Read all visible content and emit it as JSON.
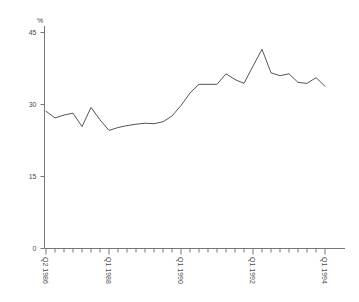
{
  "chart_data": {
    "type": "line",
    "title": "",
    "subtitle": "",
    "xlabel": "",
    "ylabel": "%",
    "ylim": [
      0,
      45
    ],
    "yticks": [
      0,
      15,
      30,
      45
    ],
    "ytick_labels": [
      "0",
      "15",
      "30",
      "45"
    ],
    "grid": false,
    "legend": null,
    "xtick_labels": [
      "Q2 1986",
      "Q1 1988",
      "Q1 1990",
      "Q1 1992",
      "Q1 1994"
    ],
    "xtick_positions": [
      0,
      7,
      15,
      23,
      31
    ],
    "minor_xticks_every": 1,
    "x": [
      "Q2 1986",
      "Q3 1986",
      "Q4 1986",
      "Q1 1987",
      "Q2 1987",
      "Q3 1987",
      "Q4 1987",
      "Q1 1988",
      "Q2 1988",
      "Q3 1988",
      "Q4 1988",
      "Q1 1989",
      "Q2 1989",
      "Q3 1989",
      "Q4 1989",
      "Q1 1990",
      "Q2 1990",
      "Q3 1990",
      "Q4 1990",
      "Q1 1991",
      "Q2 1991",
      "Q3 1991",
      "Q4 1991",
      "Q1 1992",
      "Q2 1992",
      "Q3 1992",
      "Q4 1992",
      "Q1 1993",
      "Q2 1993",
      "Q3 1993",
      "Q4 1993",
      "Q1 1994"
    ],
    "values": [
      28.6,
      27.2,
      27.8,
      28.2,
      25.4,
      29.4,
      26.8,
      24.6,
      25.2,
      25.6,
      25.9,
      26.1,
      26.0,
      26.4,
      27.6,
      29.8,
      32.4,
      34.2,
      34.2,
      34.2,
      36.4,
      35.2,
      34.4,
      38.0,
      41.5,
      36.6,
      36.0,
      36.4,
      34.6,
      34.4,
      35.6,
      33.8
    ],
    "line_color": "#555555",
    "axis_color": "#777777",
    "background_color": "#ffffff"
  }
}
